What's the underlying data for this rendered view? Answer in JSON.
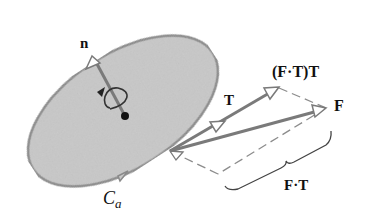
{
  "figure": {
    "type": "vector diagram",
    "colors": {
      "surface_fill": "#c8c8c8",
      "surface_edge": "#8a8a8a",
      "vector_stroke": "#7a7a7a",
      "dashed_stroke": "#8c8c8c",
      "text": "#111111",
      "background": "#ffffff"
    }
  },
  "labels": {
    "normal": "n",
    "tangent": "T",
    "projection": "(F·T)T",
    "force": "F",
    "dot_product": "F·T",
    "curve_main": "C",
    "curve_sub": "a"
  },
  "elements": {
    "surface": "elliptical-disk",
    "boundary_arrow": "counterclockwise-direction-arrow",
    "rotation_arrow": "circulation-arrow-around-normal",
    "center_point": "dot"
  }
}
